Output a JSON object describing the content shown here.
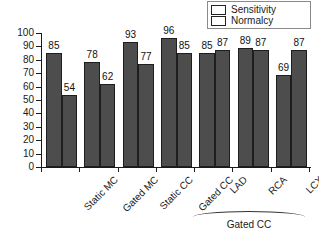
{
  "chart_data": {
    "type": "bar",
    "title": "",
    "xlabel": "",
    "ylabel": "Percent",
    "ylim": [
      0,
      100
    ],
    "yticks": [
      0,
      10,
      20,
      30,
      40,
      50,
      60,
      70,
      80,
      90,
      100
    ],
    "grid": false,
    "legend_position": "top-right",
    "categories": [
      "Static MC",
      "Gated MC",
      "Static CC",
      "Gated CC",
      "LAD",
      "RCA",
      "LCX"
    ],
    "series": [
      {
        "name": "Sensitivity",
        "color": "#4d4d4d",
        "values": [
          85,
          78,
          93,
          96,
          85,
          89,
          69
        ]
      },
      {
        "name": "Normalcy",
        "color": "#4d4d4d",
        "values": [
          54,
          62,
          77,
          85,
          87,
          87,
          87
        ]
      }
    ],
    "annotations": [
      {
        "text": "Gated CC",
        "spans_categories": [
          "LAD",
          "RCA",
          "LCX"
        ],
        "style": "bracket-below-axis"
      }
    ]
  },
  "legend": {
    "items": [
      {
        "label": "Sensitivity",
        "color": "#4d4d4d"
      },
      {
        "label": "Normalcy",
        "color": "#4d4d4d"
      }
    ]
  },
  "axes": {
    "y_title": "Percent",
    "y_tick_labels": [
      "100",
      "90",
      "80",
      "70",
      "60",
      "50",
      "40",
      "30",
      "20",
      "10",
      "0"
    ]
  },
  "group_bracket": {
    "label": "Gated CC"
  }
}
